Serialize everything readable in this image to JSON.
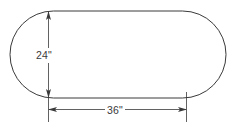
{
  "figure": {
    "type": "geometry-diagram",
    "shape_name": "stadium",
    "background_color": "#ffffff",
    "stroke_color": "#3a3a3a",
    "text_color": "#3a3a3a",
    "outline": {
      "left": 10,
      "top": 11,
      "right": 226,
      "bottom": 98,
      "corner_radius": 43.5
    },
    "dimensions": [
      {
        "id": "height",
        "label": "24\"",
        "value": 24,
        "unit": "inch",
        "orientation": "vertical",
        "axis_position": 48,
        "from": 11,
        "to": 98,
        "arrowheads": "both"
      },
      {
        "id": "width",
        "label": "36\"",
        "value": 36,
        "unit": "inch",
        "orientation": "horizontal",
        "axis_position": 109,
        "from": 48,
        "to": 186,
        "arrowheads": "both"
      }
    ],
    "extension_lines": [
      {
        "id": "left-extension",
        "x": 48,
        "from_y": 98,
        "to_y": 122
      },
      {
        "id": "right-extension",
        "x": 186,
        "from_y": 92,
        "to_y": 122
      }
    ]
  }
}
